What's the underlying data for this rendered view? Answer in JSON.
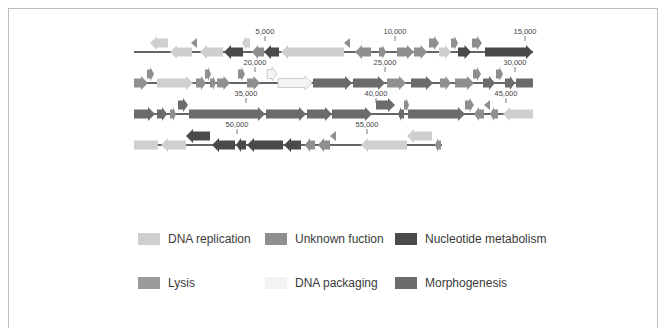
{
  "figure": {
    "type": "genome-map",
    "category_colors": {
      "dna_replication": "#cfcfcf",
      "unknown_function": "#8f8f8f",
      "nucleotide_metabolism": "#4a4a4a",
      "lysis": "#9a9a9a",
      "dna_packaging": "#f3f3f3",
      "morphogenesis": "#6b6b6b"
    },
    "rows": [
      {
        "y": 52,
        "x_start": 134,
        "x_end": 533,
        "scale_labels": [
          {
            "x": 265,
            "text": "5,000"
          },
          {
            "x": 395,
            "text": "10,000"
          },
          {
            "x": 525,
            "text": "15,000"
          }
        ],
        "genes": [
          {
            "x1": 150,
            "x2": 168,
            "dir": "L",
            "cat": "dna_replication",
            "lane": "up"
          },
          {
            "x1": 170,
            "x2": 192,
            "dir": "L",
            "cat": "dna_replication",
            "lane": "mid"
          },
          {
            "x1": 191,
            "x2": 197,
            "dir": "L",
            "cat": "unknown_function",
            "lane": "up",
            "small": true
          },
          {
            "x1": 200,
            "x2": 223,
            "dir": "L",
            "cat": "dna_replication",
            "lane": "mid"
          },
          {
            "x1": 224,
            "x2": 243,
            "dir": "L",
            "cat": "nucleotide_metabolism",
            "lane": "mid"
          },
          {
            "x1": 242,
            "x2": 250,
            "dir": "L",
            "cat": "dna_replication",
            "lane": "up"
          },
          {
            "x1": 252,
            "x2": 264,
            "dir": "L",
            "cat": "unknown_function",
            "lane": "mid"
          },
          {
            "x1": 264,
            "x2": 279,
            "dir": "L",
            "cat": "nucleotide_metabolism",
            "lane": "mid"
          },
          {
            "x1": 281,
            "x2": 344,
            "dir": "L",
            "cat": "dna_replication",
            "lane": "mid"
          },
          {
            "x1": 344,
            "x2": 350,
            "dir": "L",
            "cat": "unknown_function",
            "lane": "up",
            "small": true
          },
          {
            "x1": 355,
            "x2": 371,
            "dir": "L",
            "cat": "unknown_function",
            "lane": "mid"
          },
          {
            "x1": 379,
            "x2": 386,
            "dir": "R",
            "cat": "unknown_function",
            "lane": "mid"
          },
          {
            "x1": 397,
            "x2": 414,
            "dir": "R",
            "cat": "unknown_function",
            "lane": "mid"
          },
          {
            "x1": 414,
            "x2": 427,
            "dir": "R",
            "cat": "unknown_function",
            "lane": "mid"
          },
          {
            "x1": 429,
            "x2": 439,
            "dir": "R",
            "cat": "unknown_function",
            "lane": "up"
          },
          {
            "x1": 439,
            "x2": 451,
            "dir": "R",
            "cat": "dna_replication",
            "lane": "mid"
          },
          {
            "x1": 451,
            "x2": 458,
            "dir": "R",
            "cat": "unknown_function",
            "lane": "up"
          },
          {
            "x1": 458,
            "x2": 471,
            "dir": "R",
            "cat": "nucleotide_metabolism",
            "lane": "mid"
          },
          {
            "x1": 472,
            "x2": 482,
            "dir": "R",
            "cat": "unknown_function",
            "lane": "up"
          },
          {
            "x1": 485,
            "x2": 533,
            "dir": "R",
            "cat": "nucleotide_metabolism",
            "lane": "mid"
          }
        ]
      },
      {
        "y": 83,
        "x_start": 134,
        "x_end": 533,
        "scale_labels": [
          {
            "x": 255,
            "text": "20,000"
          },
          {
            "x": 385,
            "text": "25,000"
          },
          {
            "x": 515,
            "text": "30,000"
          }
        ],
        "genes": [
          {
            "x1": 134,
            "x2": 148,
            "dir": "R",
            "cat": "unknown_function",
            "lane": "mid"
          },
          {
            "x1": 147,
            "x2": 154,
            "dir": "R",
            "cat": "unknown_function",
            "lane": "up"
          },
          {
            "x1": 157,
            "x2": 193,
            "dir": "R",
            "cat": "dna_replication",
            "lane": "mid"
          },
          {
            "x1": 196,
            "x2": 206,
            "dir": "R",
            "cat": "unknown_function",
            "lane": "mid"
          },
          {
            "x1": 205,
            "x2": 211,
            "dir": "R",
            "cat": "unknown_function",
            "lane": "up"
          },
          {
            "x1": 210,
            "x2": 216,
            "dir": "R",
            "cat": "unknown_function",
            "lane": "mid"
          },
          {
            "x1": 217,
            "x2": 230,
            "dir": "R",
            "cat": "unknown_function",
            "lane": "mid"
          },
          {
            "x1": 238,
            "x2": 245,
            "dir": "R",
            "cat": "unknown_function",
            "lane": "up"
          },
          {
            "x1": 247,
            "x2": 260,
            "dir": "R",
            "cat": "unknown_function",
            "lane": "mid"
          },
          {
            "x1": 267,
            "x2": 277,
            "dir": "R",
            "cat": "dna_packaging",
            "lane": "up"
          },
          {
            "x1": 278,
            "x2": 312,
            "dir": "R",
            "cat": "dna_packaging",
            "lane": "mid"
          },
          {
            "x1": 313,
            "x2": 352,
            "dir": "R",
            "cat": "morphogenesis",
            "lane": "mid"
          },
          {
            "x1": 353,
            "x2": 385,
            "dir": "R",
            "cat": "morphogenesis",
            "lane": "mid"
          },
          {
            "x1": 387,
            "x2": 406,
            "dir": "R",
            "cat": "unknown_function",
            "lane": "mid"
          },
          {
            "x1": 411,
            "x2": 433,
            "dir": "R",
            "cat": "morphogenesis",
            "lane": "mid"
          },
          {
            "x1": 440,
            "x2": 451,
            "dir": "R",
            "cat": "unknown_function",
            "lane": "mid"
          },
          {
            "x1": 455,
            "x2": 474,
            "dir": "R",
            "cat": "unknown_function",
            "lane": "mid"
          },
          {
            "x1": 473,
            "x2": 481,
            "dir": "R",
            "cat": "unknown_function",
            "lane": "up"
          },
          {
            "x1": 483,
            "x2": 495,
            "dir": "R",
            "cat": "morphogenesis",
            "lane": "mid"
          },
          {
            "x1": 496,
            "x2": 503,
            "dir": "R",
            "cat": "unknown_function",
            "lane": "up"
          },
          {
            "x1": 505,
            "x2": 515,
            "dir": "R",
            "cat": "morphogenesis",
            "lane": "mid"
          },
          {
            "x1": 516,
            "x2": 533,
            "dir": "R",
            "cat": "morphogenesis",
            "lane": "mid",
            "flat": true
          }
        ]
      },
      {
        "y": 114,
        "x_start": 134,
        "x_end": 533,
        "scale_labels": [
          {
            "x": 246,
            "text": "35,000"
          },
          {
            "x": 376,
            "text": "40,000"
          },
          {
            "x": 506,
            "text": "45,000"
          }
        ],
        "genes": [
          {
            "x1": 134,
            "x2": 155,
            "dir": "R",
            "cat": "morphogenesis",
            "lane": "mid"
          },
          {
            "x1": 157,
            "x2": 167,
            "dir": "R",
            "cat": "morphogenesis",
            "lane": "mid"
          },
          {
            "x1": 170,
            "x2": 176,
            "dir": "R",
            "cat": "unknown_function",
            "lane": "mid"
          },
          {
            "x1": 178,
            "x2": 188,
            "dir": "R",
            "cat": "morphogenesis",
            "lane": "up"
          },
          {
            "x1": 189,
            "x2": 265,
            "dir": "R",
            "cat": "morphogenesis",
            "lane": "mid"
          },
          {
            "x1": 266,
            "x2": 306,
            "dir": "R",
            "cat": "morphogenesis",
            "lane": "mid"
          },
          {
            "x1": 307,
            "x2": 332,
            "dir": "R",
            "cat": "morphogenesis",
            "lane": "mid"
          },
          {
            "x1": 332,
            "x2": 372,
            "dir": "R",
            "cat": "morphogenesis",
            "lane": "mid"
          },
          {
            "x1": 376,
            "x2": 395,
            "dir": "R",
            "cat": "morphogenesis",
            "lane": "up"
          },
          {
            "x1": 398,
            "x2": 404,
            "dir": "L",
            "cat": "morphogenesis",
            "lane": "mid"
          },
          {
            "x1": 404,
            "x2": 409,
            "dir": "R",
            "cat": "unknown_function",
            "lane": "up"
          },
          {
            "x1": 408,
            "x2": 465,
            "dir": "R",
            "cat": "morphogenesis",
            "lane": "mid"
          },
          {
            "x1": 465,
            "x2": 474,
            "dir": "R",
            "cat": "unknown_function",
            "lane": "up"
          },
          {
            "x1": 474,
            "x2": 484,
            "dir": "L",
            "cat": "unknown_function",
            "lane": "mid"
          },
          {
            "x1": 484,
            "x2": 490,
            "dir": "L",
            "cat": "unknown_function",
            "lane": "up",
            "small": true
          },
          {
            "x1": 490,
            "x2": 498,
            "dir": "L",
            "cat": "unknown_function",
            "lane": "mid"
          },
          {
            "x1": 503,
            "x2": 533,
            "dir": "L",
            "cat": "dna_replication",
            "lane": "mid"
          }
        ]
      },
      {
        "y": 145,
        "x_start": 134,
        "x_end": 442,
        "scale_labels": [
          {
            "x": 237,
            "text": "50,000"
          },
          {
            "x": 367,
            "text": "55,000"
          }
        ],
        "genes": [
          {
            "x1": 134,
            "x2": 158,
            "dir": "L",
            "cat": "dna_replication",
            "lane": "mid",
            "flat": true
          },
          {
            "x1": 161,
            "x2": 186,
            "dir": "L",
            "cat": "dna_replication",
            "lane": "mid"
          },
          {
            "x1": 186,
            "x2": 210,
            "dir": "L",
            "cat": "nucleotide_metabolism",
            "lane": "up"
          },
          {
            "x1": 212,
            "x2": 235,
            "dir": "L",
            "cat": "nucleotide_metabolism",
            "lane": "mid"
          },
          {
            "x1": 236,
            "x2": 246,
            "dir": "L",
            "cat": "nucleotide_metabolism",
            "lane": "mid"
          },
          {
            "x1": 247,
            "x2": 283,
            "dir": "L",
            "cat": "nucleotide_metabolism",
            "lane": "mid"
          },
          {
            "x1": 284,
            "x2": 301,
            "dir": "L",
            "cat": "nucleotide_metabolism",
            "lane": "mid"
          },
          {
            "x1": 305,
            "x2": 315,
            "dir": "L",
            "cat": "unknown_function",
            "lane": "mid"
          },
          {
            "x1": 318,
            "x2": 330,
            "dir": "L",
            "cat": "unknown_function",
            "lane": "mid"
          },
          {
            "x1": 330,
            "x2": 336,
            "dir": "L",
            "cat": "unknown_function",
            "lane": "up",
            "small": true
          },
          {
            "x1": 322,
            "x2": 338,
            "dir": "L",
            "cat": "nucleotide_metabolism",
            "lane": "mid",
            "skip": true
          },
          {
            "x1": 361,
            "x2": 407,
            "dir": "L",
            "cat": "dna_replication",
            "lane": "mid"
          },
          {
            "x1": 407,
            "x2": 432,
            "dir": "L",
            "cat": "dna_replication",
            "lane": "up"
          },
          {
            "x1": 435,
            "x2": 441,
            "dir": "L",
            "cat": "unknown_function",
            "lane": "mid"
          }
        ]
      }
    ]
  },
  "legend": {
    "items": [
      {
        "label": "DNA replication",
        "cat": "dna_replication",
        "x": 138,
        "y": 240
      },
      {
        "label": "Unknown fuction",
        "cat": "unknown_function",
        "x": 265,
        "y": 240
      },
      {
        "label": "Nucleotide  metabolism",
        "cat": "nucleotide_metabolism",
        "x": 395,
        "y": 240
      },
      {
        "label": "Lysis",
        "cat": "lysis",
        "x": 138,
        "y": 284
      },
      {
        "label": "DNA packaging",
        "cat": "dna_packaging",
        "x": 265,
        "y": 284
      },
      {
        "label": "Morphogenesis",
        "cat": "morphogenesis",
        "x": 395,
        "y": 284
      }
    ]
  }
}
